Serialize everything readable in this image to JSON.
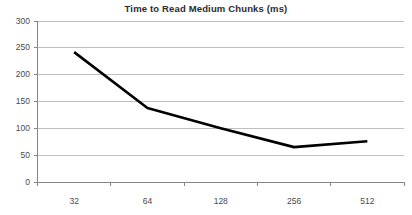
{
  "chart_data": {
    "type": "line",
    "title": "Time to Read Medium Chunks (ms)",
    "xlabel": "",
    "ylabel": "",
    "categories": [
      "32",
      "64",
      "128",
      "256",
      "512"
    ],
    "values": [
      242,
      138,
      100,
      65,
      76
    ],
    "series": [
      {
        "name": "Time to Read Medium Chunks (ms)",
        "values": [
          242,
          138,
          100,
          65,
          76
        ]
      }
    ],
    "ylim": [
      0,
      300
    ],
    "ytick_labels": [
      "0",
      "50",
      "100",
      "150",
      "200",
      "250",
      "300"
    ],
    "ytick_values": [
      0,
      50,
      100,
      150,
      200,
      250,
      300
    ],
    "grid": true,
    "grid_axis": "y",
    "legend": false,
    "legend_position": "none",
    "markers": false,
    "line_color": "#000000",
    "grid_color": "#bfbfbf",
    "axis_color": "#868686",
    "text_color": "#4a4a4a",
    "title_color": "#2b2b2b",
    "background_color": "#ffffff"
  }
}
